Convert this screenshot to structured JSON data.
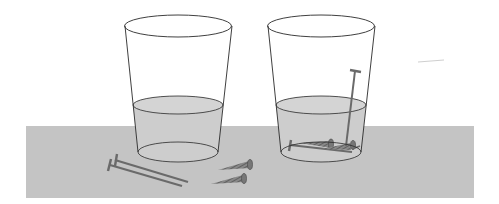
{
  "scene": {
    "description": "Two glasses of water on a gray table; left glass with nails and screws outside, right glass with nails and screws submerged",
    "colors": {
      "background": "#ffffff",
      "table": "#c4c4c4",
      "water": "#cdcdcd",
      "glass_outline": "#2a2a2a",
      "metal": "#7a7a7a"
    }
  },
  "objects": {
    "left_glass": {
      "label": "glass-with-water-empty"
    },
    "right_glass": {
      "label": "glass-with-water-and-nails"
    },
    "loose_nails": {
      "count": 2
    },
    "loose_screws": {
      "count": 2
    }
  }
}
